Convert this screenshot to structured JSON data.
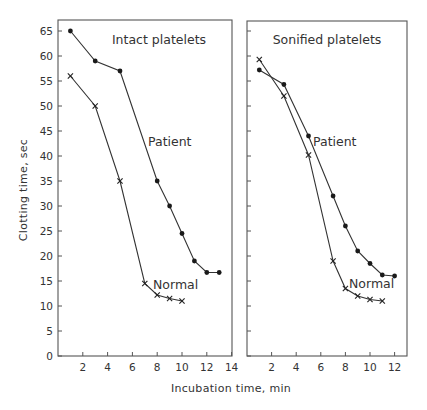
{
  "figure": {
    "ylabel": "Clotting time, sec",
    "xlabel": "Incubation time, min"
  },
  "panels": [
    {
      "title": "Intact platelets",
      "patient_label": "Patient",
      "normal_label": "Normal"
    },
    {
      "title": "Sonified platelets",
      "patient_label": "Patient",
      "normal_label": "Normal"
    }
  ],
  "chart_data": [
    {
      "type": "line",
      "title": "Intact platelets",
      "xlabel": "Incubation time, min",
      "ylabel": "Clotting time, sec",
      "xlim": [
        0,
        14
      ],
      "ylim": [
        0,
        67
      ],
      "xticks": [
        2,
        4,
        6,
        8,
        10,
        12,
        14
      ],
      "yticks": [
        0,
        5,
        10,
        15,
        20,
        25,
        30,
        35,
        40,
        45,
        50,
        55,
        60,
        65
      ],
      "grid": false,
      "series": [
        {
          "name": "Patient",
          "marker": "dot",
          "x": [
            1,
            3,
            5,
            8,
            9,
            10,
            11,
            12,
            13
          ],
          "y": [
            65,
            59,
            57,
            35,
            30,
            24.5,
            19,
            16.7,
            16.7
          ]
        },
        {
          "name": "Normal",
          "marker": "cross",
          "x": [
            1,
            3,
            5,
            7,
            8,
            9,
            10
          ],
          "y": [
            56,
            50,
            35,
            14.5,
            12.2,
            11.5,
            11
          ]
        }
      ]
    },
    {
      "type": "line",
      "title": "Sonified platelets",
      "xlabel": "Incubation time, min",
      "ylabel": "Clotting time, sec",
      "xlim": [
        0,
        13
      ],
      "ylim": [
        0,
        67
      ],
      "xticks": [
        2,
        4,
        6,
        8,
        10,
        12
      ],
      "yticks": [
        0,
        5,
        10,
        15,
        20,
        25,
        30,
        35,
        40,
        45,
        50,
        55,
        60,
        65
      ],
      "grid": false,
      "series": [
        {
          "name": "Patient",
          "marker": "dot",
          "x": [
            1,
            3,
            5,
            7,
            8,
            9,
            10,
            11,
            12
          ],
          "y": [
            57.2,
            54.3,
            44,
            32,
            26,
            21,
            18.5,
            16.2,
            16
          ]
        },
        {
          "name": "Normal",
          "marker": "cross",
          "x": [
            1,
            3,
            5,
            7,
            8,
            9,
            10,
            11
          ],
          "y": [
            59.3,
            52,
            40.2,
            19,
            13.5,
            12,
            11.3,
            11
          ]
        }
      ]
    }
  ]
}
